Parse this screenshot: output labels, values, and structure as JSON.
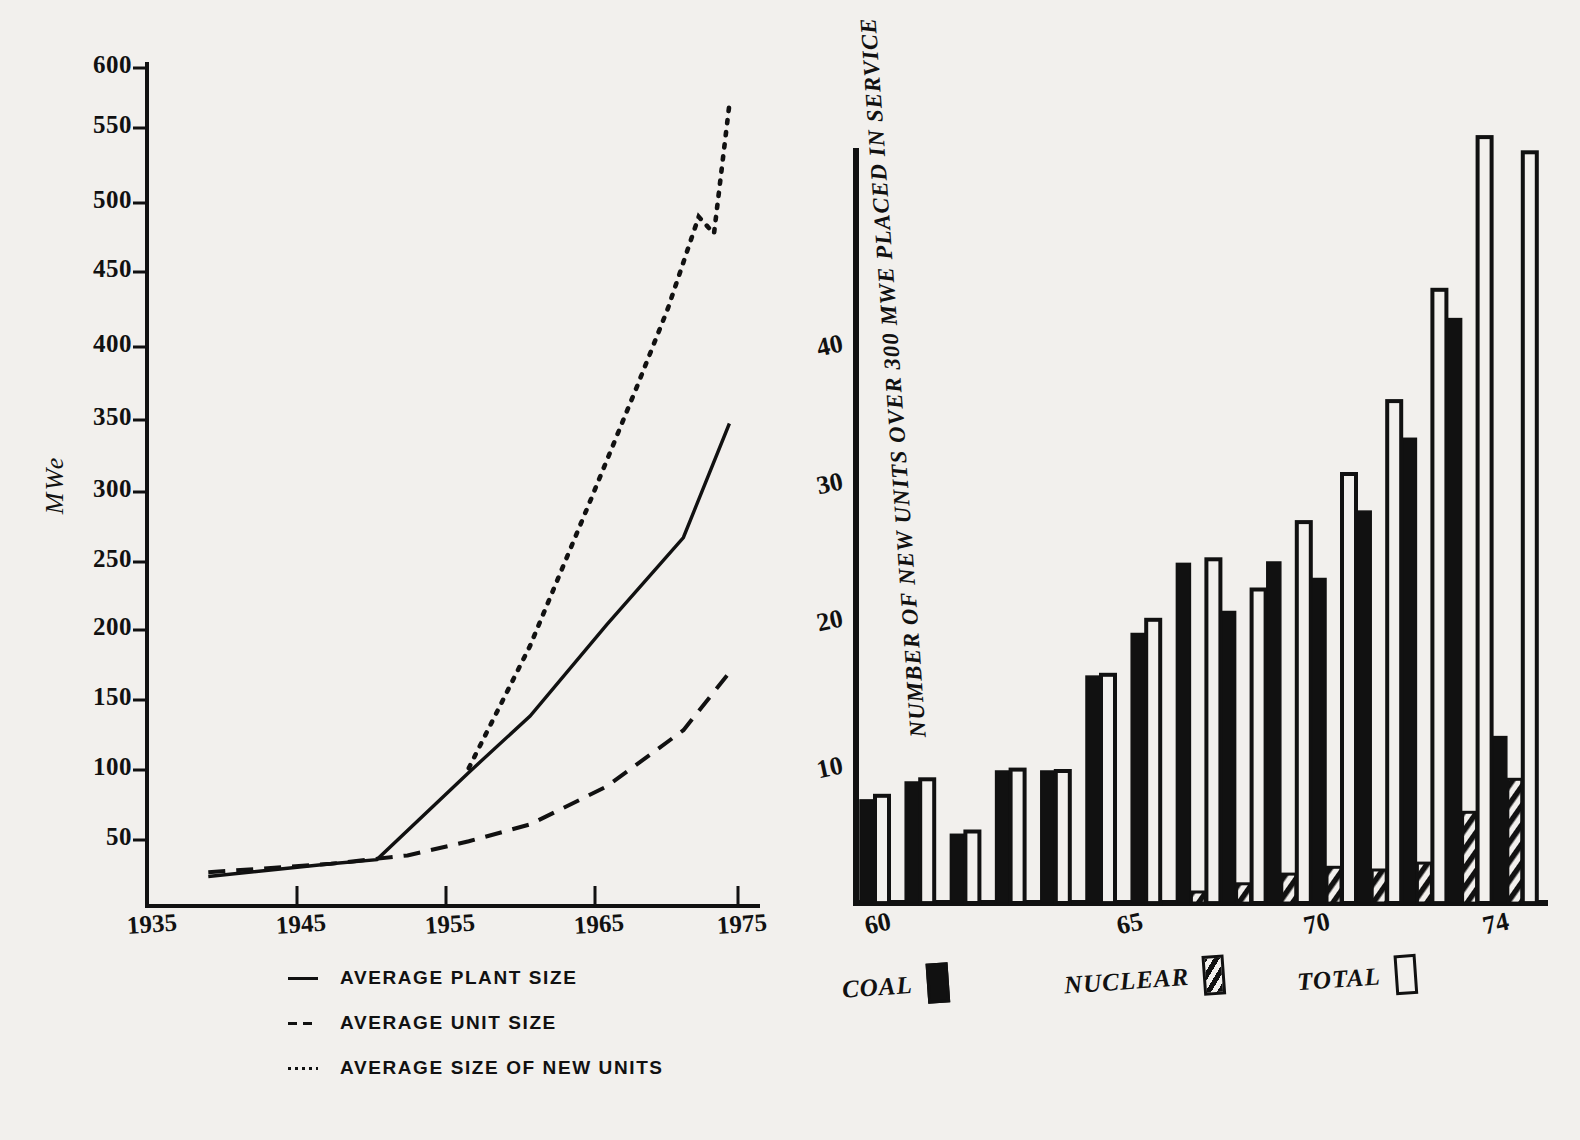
{
  "chart_data": [
    {
      "type": "line",
      "id": "plant-unit-size",
      "title": "",
      "xlabel": "",
      "ylabel": "MWe",
      "xlim": [
        1935,
        1975
      ],
      "ylim": [
        0,
        600
      ],
      "xticks": [
        "1935",
        "1945",
        "1955",
        "1965",
        "1975"
      ],
      "yticks": [
        "50",
        "100",
        "150",
        "200",
        "250",
        "300",
        "350",
        "400",
        "450",
        "500",
        "550",
        "600"
      ],
      "grid": false,
      "legend_position": "below-axes",
      "series": [
        {
          "name": "AVERAGE  PLANT SIZE",
          "style": "solid",
          "x": [
            1939,
            1947,
            1950,
            1956,
            1960,
            1965,
            1970,
            1973
          ],
          "y": [
            21,
            30,
            33,
            95,
            135,
            200,
            262,
            343
          ]
        },
        {
          "name": "AVERAGE  UNIT SIZE",
          "style": "dashed",
          "x": [
            1939,
            1947,
            1952,
            1956,
            1960,
            1965,
            1970,
            1973
          ],
          "y": [
            24,
            30,
            36,
            46,
            58,
            85,
            125,
            166
          ]
        },
        {
          "name": "AVERAGE  SIZE OF NEW UNITS",
          "style": "dotted",
          "x": [
            1956,
            1960,
            1964,
            1967,
            1969,
            1971,
            1972,
            1973
          ],
          "y": [
            98,
            185,
            290,
            370,
            425,
            490,
            478,
            570
          ]
        }
      ]
    },
    {
      "type": "bar",
      "id": "new-units-over-300-mwe",
      "title": "",
      "ylabel": "NUMBER OF NEW UNITS OVER 300 MWE PLACED IN SERVICE",
      "xlabel": "",
      "ylim": [
        0,
        52
      ],
      "yticks": [
        "10",
        "20",
        "30",
        "40"
      ],
      "xticks": [
        "60",
        "65",
        "70",
        "74"
      ],
      "categories": [
        "60",
        "61",
        "62",
        "63",
        "64",
        "65",
        "66",
        "67",
        "68",
        "69",
        "70",
        "71",
        "72",
        "73",
        "74"
      ],
      "grid": false,
      "legend_position": "below-axes",
      "series": [
        {
          "name": "COAL",
          "fill": "solid",
          "values": [
            7.5,
            8.8,
            5.0,
            9.6,
            9.6,
            16.5,
            19.6,
            24.7,
            21.2,
            24.8,
            23.6,
            28.5,
            33.8,
            42.5,
            12.1
          ]
        },
        {
          "name": "NUCLEAR",
          "fill": "hatched",
          "values": [
            0,
            0,
            0,
            0,
            0,
            0,
            0,
            0.8,
            1.4,
            2.1,
            2.6,
            2.4,
            2.9,
            6.6,
            9.0
          ]
        },
        {
          "name": "TOTAL",
          "fill": "outline",
          "values": [
            7.8,
            9.0,
            5.2,
            9.7,
            9.6,
            16.6,
            20.6,
            25.0,
            22.8,
            27.7,
            31.2,
            36.5,
            44.6,
            55.7,
            54.6
          ]
        }
      ]
    }
  ],
  "left_axis": {
    "yticks": [
      {
        "label": "600",
        "y": 68
      },
      {
        "label": "550",
        "y": 128
      },
      {
        "label": "500",
        "y": 203
      },
      {
        "label": "450",
        "y": 272
      },
      {
        "label": "400",
        "y": 347
      },
      {
        "label": "350",
        "y": 420
      },
      {
        "label": "300",
        "y": 492
      },
      {
        "label": "250",
        "y": 562
      },
      {
        "label": "200",
        "y": 630
      },
      {
        "label": "150",
        "y": 700
      },
      {
        "label": "100",
        "y": 770
      },
      {
        "label": "50",
        "y": 840
      }
    ],
    "xticks": [
      {
        "label": "1935",
        "x": 126
      },
      {
        "label": "1945",
        "x": 275
      },
      {
        "label": "1955",
        "x": 424
      },
      {
        "label": "1965",
        "x": 573
      },
      {
        "label": "1975",
        "x": 716
      }
    ],
    "ylabel": "MWe"
  },
  "left_legend": [
    {
      "label": "AVERAGE  PLANT SIZE",
      "swatch": "solid-line-swatch"
    },
    {
      "label": "AVERAGE  UNIT SIZE",
      "swatch": "dashed-line-swatch"
    },
    {
      "label": "AVERAGE  SIZE OF NEW UNITS",
      "swatch": "dotted-line-swatch"
    }
  ],
  "right_axis": {
    "title": "NUMBER OF NEW UNITS OVER 300 MWE PLACED IN SERVICE",
    "yticks": [
      {
        "label": "10",
        "y": 774
      },
      {
        "label": "20",
        "y": 627
      },
      {
        "label": "30",
        "y": 490
      },
      {
        "label": "40",
        "y": 352
      }
    ],
    "xticks": [
      {
        "label": "60",
        "x": 82
      },
      {
        "label": "65",
        "x": 334
      },
      {
        "label": "70",
        "x": 521
      },
      {
        "label": "74",
        "x": 700
      }
    ]
  },
  "right_legend": [
    {
      "label": "COAL",
      "key": "coal-key-solid-black",
      "left": 0
    },
    {
      "label": "NUCLEAR",
      "key": "nuclear-key-hatched",
      "left": 222
    },
    {
      "label": "TOTAL",
      "key": "total-key-outline",
      "left": 455
    }
  ]
}
